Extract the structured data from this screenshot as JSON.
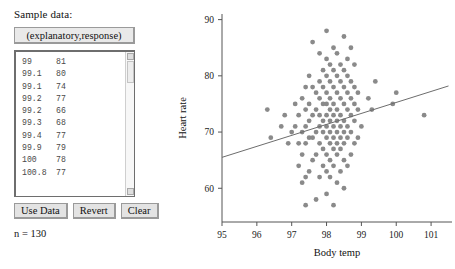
{
  "panel": {
    "label": "Sample data:",
    "header_button": "(explanatory,response)",
    "rows": [
      {
        "x": "99",
        "y": "81"
      },
      {
        "x": "99.1",
        "y": "80"
      },
      {
        "x": "99.1",
        "y": "74"
      },
      {
        "x": "99.2",
        "y": "77"
      },
      {
        "x": "99.2",
        "y": "66"
      },
      {
        "x": "99.3",
        "y": "68"
      },
      {
        "x": "99.4",
        "y": "77"
      },
      {
        "x": "99.9",
        "y": "79"
      },
      {
        "x": "100",
        "y": "78"
      },
      {
        "x": "100.8",
        "y": "77"
      }
    ],
    "buttons": [
      {
        "label": "Use Data",
        "name": "use-data-button"
      },
      {
        "label": "Revert",
        "name": "revert-button"
      },
      {
        "label": "Clear",
        "name": "clear-button"
      }
    ],
    "n_count": "n = 130",
    "scrollbar": {
      "up_glyph": "▴",
      "down_glyph": "▾"
    }
  },
  "colors": {
    "point": "#8a8a8a",
    "line": "#6d6d6d",
    "axis": "#555555",
    "button_face": "#e3e3e3",
    "panel_border": "#6e6e6e"
  },
  "chart_data": {
    "type": "scatter",
    "title": "",
    "xlabel": "Body temp",
    "ylabel": "Heart rate",
    "xlim": [
      95,
      101.6
    ],
    "ylim": [
      54,
      91
    ],
    "xticks": [
      95,
      96,
      97,
      98,
      99,
      100,
      101
    ],
    "yticks": [
      60,
      70,
      80,
      90
    ],
    "grid": false,
    "legend": null,
    "n": 130,
    "trendline": {
      "x": [
        95.0,
        101.5
      ],
      "y": [
        65.5,
        78.2
      ]
    },
    "points": [
      [
        96.4,
        69
      ],
      [
        96.7,
        71
      ],
      [
        96.8,
        73
      ],
      [
        96.9,
        68
      ],
      [
        97.0,
        70
      ],
      [
        97.1,
        71
      ],
      [
        97.1,
        75
      ],
      [
        97.2,
        64
      ],
      [
        97.2,
        68
      ],
      [
        97.2,
        73
      ],
      [
        97.3,
        61
      ],
      [
        97.3,
        66
      ],
      [
        97.3,
        70
      ],
      [
        97.3,
        76
      ],
      [
        97.4,
        57
      ],
      [
        97.4,
        62
      ],
      [
        97.4,
        68
      ],
      [
        97.4,
        71
      ],
      [
        97.4,
        74
      ],
      [
        97.4,
        78
      ],
      [
        97.5,
        63
      ],
      [
        97.5,
        69
      ],
      [
        97.5,
        72
      ],
      [
        97.5,
        75
      ],
      [
        97.5,
        80
      ],
      [
        97.6,
        65
      ],
      [
        97.6,
        69
      ],
      [
        97.6,
        73
      ],
      [
        97.6,
        78
      ],
      [
        97.6,
        86
      ],
      [
        97.7,
        58
      ],
      [
        97.7,
        66
      ],
      [
        97.7,
        70
      ],
      [
        97.7,
        74
      ],
      [
        97.7,
        77
      ],
      [
        97.8,
        62
      ],
      [
        97.8,
        68
      ],
      [
        97.8,
        71
      ],
      [
        97.8,
        73
      ],
      [
        97.8,
        76
      ],
      [
        97.8,
        79
      ],
      [
        97.8,
        84
      ],
      [
        97.9,
        64
      ],
      [
        97.9,
        67
      ],
      [
        97.9,
        70
      ],
      [
        97.9,
        72
      ],
      [
        97.9,
        75
      ],
      [
        97.9,
        78
      ],
      [
        97.9,
        81
      ],
      [
        98.0,
        59
      ],
      [
        98.0,
        63
      ],
      [
        98.0,
        66
      ],
      [
        98.0,
        69
      ],
      [
        98.0,
        71
      ],
      [
        98.0,
        73
      ],
      [
        98.0,
        75
      ],
      [
        98.0,
        77
      ],
      [
        98.0,
        80
      ],
      [
        98.0,
        83
      ],
      [
        98.0,
        88
      ],
      [
        98.1,
        62
      ],
      [
        98.1,
        65
      ],
      [
        98.1,
        68
      ],
      [
        98.1,
        70
      ],
      [
        98.1,
        72
      ],
      [
        98.1,
        74
      ],
      [
        98.1,
        76
      ],
      [
        98.1,
        79
      ],
      [
        98.1,
        82
      ],
      [
        98.2,
        57
      ],
      [
        98.2,
        64
      ],
      [
        98.2,
        67
      ],
      [
        98.2,
        69
      ],
      [
        98.2,
        71
      ],
      [
        98.2,
        73
      ],
      [
        98.2,
        75
      ],
      [
        98.2,
        78
      ],
      [
        98.2,
        81
      ],
      [
        98.2,
        85
      ],
      [
        98.3,
        61
      ],
      [
        98.3,
        66
      ],
      [
        98.3,
        68
      ],
      [
        98.3,
        70
      ],
      [
        98.3,
        72
      ],
      [
        98.3,
        74
      ],
      [
        98.3,
        77
      ],
      [
        98.3,
        80
      ],
      [
        98.3,
        84
      ],
      [
        98.4,
        63
      ],
      [
        98.4,
        67
      ],
      [
        98.4,
        69
      ],
      [
        98.4,
        71
      ],
      [
        98.4,
        73
      ],
      [
        98.4,
        76
      ],
      [
        98.4,
        79
      ],
      [
        98.4,
        82
      ],
      [
        98.5,
        60
      ],
      [
        98.5,
        65
      ],
      [
        98.5,
        68
      ],
      [
        98.5,
        70
      ],
      [
        98.5,
        72
      ],
      [
        98.5,
        75
      ],
      [
        98.5,
        78
      ],
      [
        98.5,
        81
      ],
      [
        98.5,
        87
      ],
      [
        98.6,
        64
      ],
      [
        98.6,
        69
      ],
      [
        98.6,
        71
      ],
      [
        98.6,
        74
      ],
      [
        98.6,
        77
      ],
      [
        98.6,
        80
      ],
      [
        98.6,
        83
      ],
      [
        98.7,
        66
      ],
      [
        98.7,
        70
      ],
      [
        98.7,
        73
      ],
      [
        98.7,
        76
      ],
      [
        98.7,
        79
      ],
      [
        98.7,
        85
      ],
      [
        98.8,
        68
      ],
      [
        98.8,
        72
      ],
      [
        98.8,
        75
      ],
      [
        98.8,
        78
      ],
      [
        98.8,
        82
      ],
      [
        98.9,
        69
      ],
      [
        98.9,
        74
      ],
      [
        98.9,
        77
      ],
      [
        99.0,
        71
      ],
      [
        99.2,
        76
      ],
      [
        99.3,
        74
      ],
      [
        99.4,
        79
      ],
      [
        99.9,
        75
      ],
      [
        100.0,
        77
      ],
      [
        100.8,
        73
      ],
      [
        96.3,
        74
      ]
    ]
  }
}
